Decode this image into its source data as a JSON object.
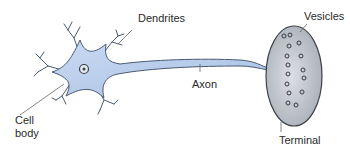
{
  "diagram": {
    "type": "neuron",
    "colors": {
      "neuron_fill": "#b9cdea",
      "neuron_stroke": "#4a5a72",
      "terminal_fill": "#c6cbd2",
      "terminal_stroke": "#3d4048",
      "vesicle_stroke": "#3a3a42",
      "leader_line": "#666666"
    },
    "labels": {
      "dendrites": "Dendrites",
      "axon": "Axon",
      "cell_body_line1": "Cell",
      "cell_body_line2": "body",
      "vesicles": "Vesicles",
      "terminal": "Terminal"
    },
    "vesicle_count": 18
  }
}
